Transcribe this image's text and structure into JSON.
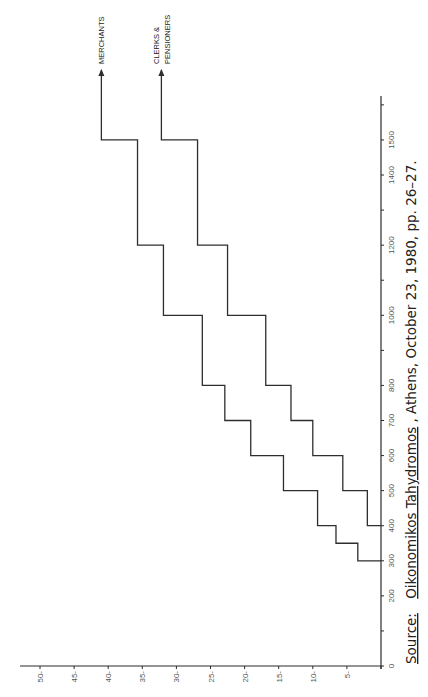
{
  "chart_data": {
    "type": "line",
    "subtype": "step",
    "orientation": "rotated-90",
    "title": "",
    "xlabel": "",
    "ylabel": "",
    "x_axis": {
      "description": "income level (runs vertically along right edge, 0 at bottom)",
      "range": [
        0,
        1600
      ],
      "ticks": [
        0,
        100,
        200,
        300,
        400,
        500,
        600,
        700,
        800,
        900,
        1000,
        1100,
        1200,
        1300,
        1400,
        1500,
        1600
      ],
      "tick_labels": [
        "0",
        "200",
        "300",
        "400",
        "500",
        "600",
        "700",
        "800",
        "1000",
        "1200",
        "1400",
        "1500"
      ]
    },
    "y_axis": {
      "description": "percentage (runs horizontally along bottom, 0 at right)",
      "range": [
        0,
        50
      ],
      "ticks": [
        0,
        5,
        10,
        15,
        20,
        25,
        30,
        35,
        40,
        45,
        50
      ],
      "tick_labels": [
        "0",
        "5",
        "10",
        "15",
        "20",
        "25",
        "30",
        "35",
        "40",
        "45",
        "50"
      ]
    },
    "grid": false,
    "legend": "labels at arrow ends (top)",
    "series": [
      {
        "name": "MERCHANTS",
        "label_lines": [
          "MERCHANTS"
        ],
        "x": [
          300,
          350,
          400,
          500,
          600,
          700,
          800,
          1000,
          1200,
          1500
        ],
        "values": [
          3.4,
          6.6,
          9.3,
          14.3,
          19.1,
          22.9,
          26.2,
          31.9,
          35.7,
          41.0
        ],
        "arrow_end": 1700
      },
      {
        "name": "CLERKS & PENSIONERS",
        "label_lines": [
          "CLERKS &",
          "PENSIONERS"
        ],
        "x": [
          400,
          500,
          600,
          700,
          800,
          1000,
          1200,
          1500
        ],
        "values": [
          2.0,
          5.6,
          10.0,
          13.2,
          16.9,
          22.5,
          26.9,
          32.2
        ],
        "arrow_end": 1700
      }
    ]
  },
  "source": {
    "prefix": "Source:",
    "publication": "Oikonomikos Tahydromos",
    "rest": ", Athens, October 23, 1980, pp. 26–27."
  }
}
